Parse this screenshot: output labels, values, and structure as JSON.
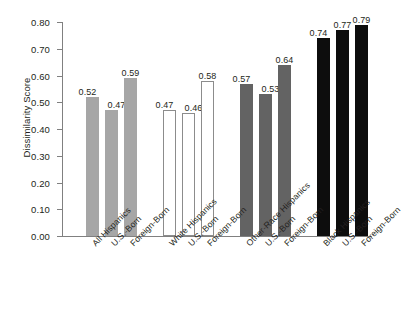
{
  "chart_data": {
    "type": "bar",
    "title": "",
    "xlabel": "",
    "ylabel": "Dissimilarity Score",
    "ylim": [
      0.0,
      0.8
    ],
    "ytick_labels": [
      "0.00",
      "0.10",
      "0.20",
      "0.30",
      "0.40",
      "0.50",
      "0.60",
      "0.70",
      "0.80"
    ],
    "ytick_values": [
      0.0,
      0.1,
      0.2,
      0.3,
      0.4,
      0.5,
      0.6,
      0.7,
      0.8
    ],
    "grid": false,
    "legend": "none",
    "categories": [
      "All Hispanics",
      "U.S.-Born",
      "Foreign-Born",
      "White Hispanics",
      "U.S.-Born",
      "Foreign-Born",
      "Other-Race Hispanics",
      "U.S.-Born",
      "Foreign-Born",
      "Black Hispanics",
      "U.S.-Born",
      "Foreign-Born"
    ],
    "values": [
      0.52,
      0.47,
      0.59,
      0.47,
      0.46,
      0.58,
      0.57,
      0.53,
      0.64,
      0.74,
      0.77,
      0.79
    ],
    "value_labels": [
      "0.52",
      "0.47",
      "0.59",
      "0.47",
      "0.46",
      "0.58",
      "0.57",
      "0.53",
      "0.64",
      "0.74",
      "0.77",
      "0.79"
    ],
    "groups": [
      {
        "name": "All Hispanics",
        "fill": "#a6a6a6",
        "stroke": "#a6a6a6"
      },
      {
        "name": "White Hispanics",
        "fill": "#ffffff",
        "stroke": "#8c8c8c"
      },
      {
        "name": "Other-Race Hispanics",
        "fill": "#636363",
        "stroke": "#636363"
      },
      {
        "name": "Black Hispanics",
        "fill": "#0d0d0d",
        "stroke": "#0d0d0d"
      }
    ],
    "bars": [
      {
        "label": "All Hispanics",
        "value": 0.52,
        "value_label": "0.52",
        "fill": "#a6a6a6",
        "stroke": "#a6a6a6"
      },
      {
        "label": "U.S.-Born",
        "value": 0.47,
        "value_label": "0.47",
        "fill": "#a6a6a6",
        "stroke": "#a6a6a6"
      },
      {
        "label": "Foreign-Born",
        "value": 0.59,
        "value_label": "0.59",
        "fill": "#a6a6a6",
        "stroke": "#a6a6a6"
      },
      {
        "label": "White Hispanics",
        "value": 0.47,
        "value_label": "0.47",
        "fill": "#ffffff",
        "stroke": "#8c8c8c"
      },
      {
        "label": "U.S.-Born",
        "value": 0.46,
        "value_label": "0.46",
        "fill": "#ffffff",
        "stroke": "#8c8c8c"
      },
      {
        "label": "Foreign-Born",
        "value": 0.58,
        "value_label": "0.58",
        "fill": "#ffffff",
        "stroke": "#8c8c8c"
      },
      {
        "label": "Other-Race Hispanics",
        "value": 0.57,
        "value_label": "0.57",
        "fill": "#636363",
        "stroke": "#636363"
      },
      {
        "label": "U.S.-Born",
        "value": 0.53,
        "value_label": "0.53",
        "fill": "#636363",
        "stroke": "#636363"
      },
      {
        "label": "Foreign-Born",
        "value": 0.64,
        "value_label": "0.64",
        "fill": "#636363",
        "stroke": "#636363"
      },
      {
        "label": "Black Hispanics",
        "value": 0.74,
        "value_label": "0.74",
        "fill": "#0d0d0d",
        "stroke": "#0d0d0d"
      },
      {
        "label": "U.S.-Born",
        "value": 0.77,
        "value_label": "0.77",
        "fill": "#0d0d0d",
        "stroke": "#0d0d0d"
      },
      {
        "label": "Foreign-Born",
        "value": 0.79,
        "value_label": "0.79",
        "fill": "#0d0d0d",
        "stroke": "#0d0d0d"
      }
    ]
  }
}
